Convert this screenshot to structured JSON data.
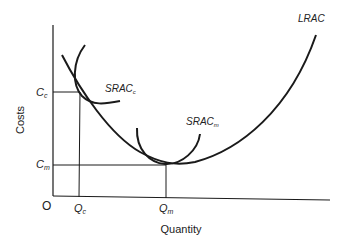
{
  "diagram": {
    "type": "economics-cost-curves",
    "axes": {
      "y_label": "Costs",
      "x_label": "Quantity",
      "origin": "O"
    },
    "y_ticks": [
      {
        "main": "C",
        "sub": "c"
      },
      {
        "main": "C",
        "sub": "m"
      }
    ],
    "x_ticks": [
      {
        "main": "Q",
        "sub": "c"
      },
      {
        "main": "Q",
        "sub": "m"
      }
    ],
    "curves": {
      "lrac": "LRAC",
      "srac_c": {
        "main": "SRAC",
        "sub": "c"
      },
      "srac_m": {
        "main": "SRAC",
        "sub": "m"
      }
    },
    "colors": {
      "line": "#1a1a1a",
      "text": "#222222",
      "background": "#ffffff"
    }
  }
}
